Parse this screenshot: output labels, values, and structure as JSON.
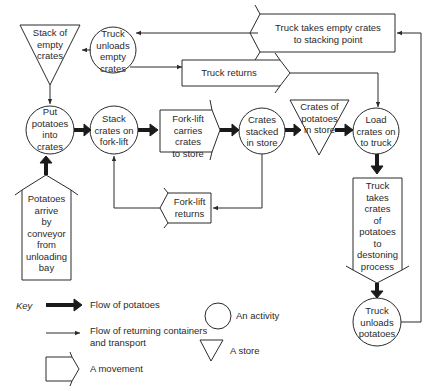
{
  "nodes": {
    "stack_empty_crates": {
      "type": "store",
      "label": "Stack of\nempty\ncrates"
    },
    "truck_unloads_empty": {
      "type": "activity",
      "label": "Truck\nunloads\nempty\ncrates"
    },
    "truck_takes_empty": {
      "type": "movement",
      "label": "Truck takes empty crates\nto stacking point"
    },
    "truck_returns": {
      "type": "movement",
      "label": "Truck returns"
    },
    "put_potatoes": {
      "type": "activity",
      "label": "Put\npotatoes\ninto\ncrates"
    },
    "stack_on_forklift": {
      "type": "activity",
      "label": "Stack\ncrates on\nfork-lift"
    },
    "forklift_carries": {
      "type": "movement",
      "label": "Fork-lift\ncarries crates\nto store"
    },
    "crates_stacked": {
      "type": "activity",
      "label": "Crates\nstacked\nin store"
    },
    "crates_in_store": {
      "type": "store",
      "label": "Crates of\npotatoes\nin store"
    },
    "load_truck": {
      "type": "activity",
      "label": "Load\ncrates on\nto truck"
    },
    "potatoes_arrive": {
      "type": "movement",
      "label": "Potatoes\narrive\nby\nconveyor\nfrom\nunloading\nbay"
    },
    "forklift_returns": {
      "type": "movement",
      "label": "Fork-lift\nreturns"
    },
    "truck_takes_potatoes": {
      "type": "movement",
      "label": "Truck\ntakes\ncrates\nof\npotatoes\nto\ndestoning\nprocess"
    },
    "truck_unloads_potatoes": {
      "type": "activity",
      "label": "Truck\nunloads\npotatoes"
    }
  },
  "key": {
    "title": "Key",
    "flow_potatoes": "Flow of potatoes",
    "flow_returning": "Flow of returning containers\nand transport",
    "movement": "A movement",
    "activity": "An activity",
    "store": "A store"
  },
  "colors": {
    "line": "#2a2a2a",
    "background": "#ffffff"
  }
}
